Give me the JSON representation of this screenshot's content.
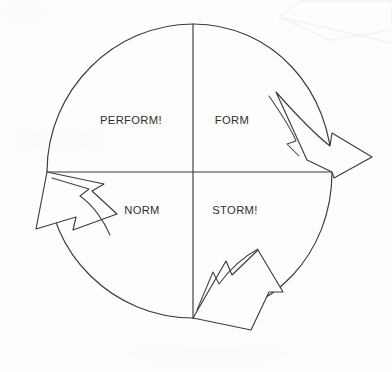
{
  "document": {
    "title": "Team Development Cycle",
    "media": "scanned line drawing",
    "background_color": "#fdfdfd",
    "ink_color": "#3a3a3c"
  },
  "diagram": {
    "type": "cycle-diagram",
    "shape": "circle-divided-in-quadrants",
    "direction": "clockwise",
    "geometry": {
      "center_x": 193,
      "center_y": 172,
      "radius_x": 143,
      "radius_y": 147
    },
    "quadrants": [
      {
        "id": "form",
        "label": "FORM",
        "position": "top-right",
        "label_x": 232,
        "label_y": 121
      },
      {
        "id": "storm",
        "label": "STORM!",
        "position": "bottom-right",
        "label_x": 235,
        "label_y": 211
      },
      {
        "id": "norm",
        "label": "NORM",
        "position": "bottom-left",
        "label_x": 142,
        "label_y": 211
      },
      {
        "id": "perform",
        "label": "PERFORM!",
        "position": "top-left",
        "label_x": 131,
        "label_y": 121
      }
    ],
    "arrows": [
      {
        "id": "arrow-right",
        "points_to": "storm",
        "position": "right-edge",
        "direction": "down-right"
      },
      {
        "id": "arrow-bottom",
        "points_to": "norm",
        "position": "bottom-edge",
        "direction": "down-right"
      },
      {
        "id": "arrow-left",
        "points_to": "perform",
        "position": "left-edge",
        "direction": "down-left"
      }
    ],
    "axes": [
      {
        "id": "vertical-divider",
        "from_x": 193,
        "from_y": 24,
        "to_x": 193,
        "to_y": 318
      },
      {
        "id": "horizontal-divider",
        "from_x": 47,
        "from_y": 172,
        "to_x": 332,
        "to_y": 172
      }
    ]
  }
}
